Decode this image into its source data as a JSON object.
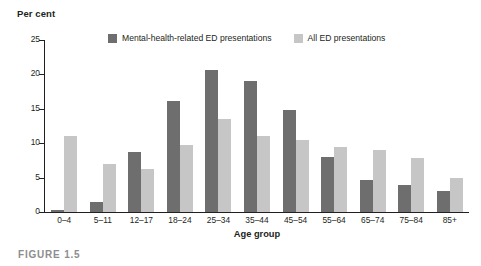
{
  "caption": "FIGURE 1.5",
  "legend": {
    "position": "top-center",
    "entries": [
      {
        "label": "Mental-health-related ED presentations",
        "color": "#6e6e6e",
        "swatch_name": "legend-swatch-dark"
      },
      {
        "label": "All ED presentations",
        "color": "#c6c6c6",
        "swatch_name": "legend-swatch-light"
      }
    ]
  },
  "chart_data": {
    "type": "bar",
    "title": "",
    "subtitle": "",
    "xlabel": "Age group",
    "ylabel": "Per cent",
    "ylim": [
      0,
      25
    ],
    "yticks": [
      0,
      5,
      10,
      15,
      20,
      25
    ],
    "ytick_labels": [
      "0",
      "5",
      "10",
      "15",
      "20",
      "25"
    ],
    "grid": false,
    "categories": [
      "0–4",
      "5–11",
      "12–17",
      "18–24",
      "25–34",
      "35–44",
      "45–54",
      "55–64",
      "65–74",
      "75–84",
      "85+"
    ],
    "series": [
      {
        "name": "Mental-health-related ED presentations",
        "color": "#6e6e6e",
        "values": [
          0.3,
          1.5,
          8.7,
          16.1,
          20.6,
          19.1,
          14.9,
          8.0,
          4.7,
          3.9,
          3.1
        ]
      },
      {
        "name": "All ED presentations",
        "color": "#c6c6c6",
        "values": [
          11.0,
          7.0,
          6.2,
          9.8,
          13.5,
          11.0,
          10.4,
          9.5,
          9.0,
          7.8,
          5.0
        ]
      }
    ]
  }
}
